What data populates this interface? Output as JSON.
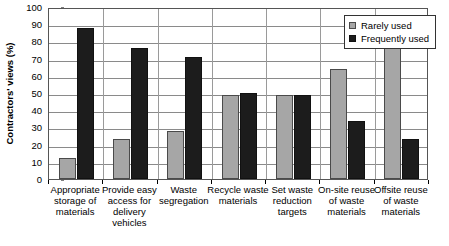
{
  "chart_data": {
    "type": "bar",
    "title": "",
    "xlabel": "",
    "ylabel": "Contractors' views (%)",
    "ylim": [
      0,
      100
    ],
    "ytick_step": 10,
    "yticks": [
      0,
      10,
      20,
      30,
      40,
      50,
      60,
      70,
      80,
      90,
      100
    ],
    "grid": true,
    "legend_position": "top-right",
    "categories": [
      "Appropriate storage of materials",
      "Provide easy access for delivery vehicles",
      "Waste segregation",
      "Recycle waste materials",
      "Set waste reduction targets",
      "On-site reuse of waste materials",
      "Offsite reuse of waste materials"
    ],
    "series": [
      {
        "name": "Rarely used",
        "color": "#a6a6a6",
        "values": [
          12,
          23,
          28,
          49,
          49,
          64,
          76
        ]
      },
      {
        "name": "Frequently used",
        "color": "#1c1c1c",
        "values": [
          88,
          76,
          71,
          50,
          49,
          34,
          23
        ]
      }
    ]
  },
  "legend": {
    "items": [
      {
        "label": "Rarely used",
        "swatch": "rarely"
      },
      {
        "label": "Frequently used",
        "swatch": "frequently"
      }
    ]
  }
}
